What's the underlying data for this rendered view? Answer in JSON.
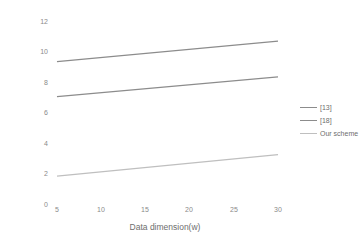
{
  "chart_data": {
    "type": "line",
    "title": "",
    "xlabel": "Data dimension(w)",
    "ylabel": "Computation costs of a SM(ms)",
    "xlim": [
      5,
      30
    ],
    "ylim": [
      0,
      12
    ],
    "xticks": [
      "5",
      "10",
      "15",
      "20",
      "25",
      "30"
    ],
    "yticks": [
      "0",
      "2",
      "4",
      "6",
      "8",
      "10",
      "12"
    ],
    "grid": false,
    "legend_position": "right",
    "x": [
      5,
      30
    ],
    "series": [
      {
        "name": "[13]",
        "values": [
          9.4,
          10.75
        ],
        "color": "#8c8c8c"
      },
      {
        "name": "[18]",
        "values": [
          7.1,
          8.4
        ],
        "color": "#8c8c8c"
      },
      {
        "name": "Our scheme",
        "values": [
          1.9,
          3.3
        ],
        "color": "#bfbfbf"
      }
    ]
  },
  "legend": {
    "items": [
      {
        "label": "[13]",
        "color": "#8c8c8c"
      },
      {
        "label": "[18]",
        "color": "#8c8c8c"
      },
      {
        "label": "Our scheme",
        "color": "#bfbfbf"
      }
    ]
  },
  "axes": {
    "y": {
      "label": "Computation costs of a SM(ms)",
      "ticks": [
        "0",
        "2",
        "4",
        "6",
        "8",
        "10",
        "12"
      ]
    },
    "x": {
      "label": "Data dimension(w)",
      "ticks": [
        "5",
        "10",
        "15",
        "20",
        "25",
        "30"
      ]
    }
  }
}
